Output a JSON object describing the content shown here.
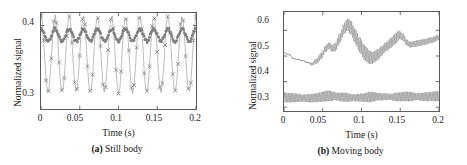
{
  "figure": {
    "panels": [
      {
        "id": "a",
        "caption_tag": "(a)",
        "caption_text": "Still body",
        "chart": {
          "type": "line",
          "title": "",
          "xlabel": "Time (s)",
          "ylabel": "Normalized signal",
          "xlim": [
            0,
            0.2
          ],
          "ylim": [
            0.3,
            0.415
          ],
          "xticks": [
            0,
            0.05,
            0.1,
            0.15,
            0.2
          ],
          "xticklabels": [
            "0",
            "0.05",
            "0.1",
            "0.15",
            "0.2"
          ],
          "yticks": [
            0.3,
            0.4
          ],
          "yticklabels": [
            "0.3",
            "0.4"
          ],
          "grid": false,
          "legend": "none",
          "series": [
            {
              "name": "large-oscillation-trace",
              "marker": "x",
              "color": "#6e6e6e",
              "period_s": 0.0182,
              "mean": 0.3655,
              "amplitude": 0.0455,
              "phase": 0.0,
              "jitter": 0.004,
              "n_points": 120,
              "y_min": 0.318,
              "y_max": 0.413
            },
            {
              "name": "small-oscillation-trace",
              "marker": "filled-circle",
              "color": "#7a7a7a",
              "period_s": 0.0182,
              "mean": 0.3885,
              "amplitude": 0.0075,
              "phase": 0.0,
              "jitter": 0.0035,
              "n_points": 200,
              "y_min": 0.378,
              "y_max": 0.401
            }
          ]
        }
      },
      {
        "id": "b",
        "caption_tag": "(b)",
        "caption_text": "Moving body",
        "chart": {
          "type": "line",
          "title": "",
          "xlabel": "Time (s)",
          "ylabel": "Normalized signal",
          "xlim": [
            0,
            0.2
          ],
          "ylim": [
            0.285,
            0.672
          ],
          "xticks": [
            0,
            0.05,
            0.1,
            0.15,
            0.2
          ],
          "xticklabels": [
            "0",
            "0.05",
            "0.1",
            "0.15",
            "0.2"
          ],
          "yticks": [
            0.3,
            0.4,
            0.5,
            0.6
          ],
          "yticklabels": [
            "0.3",
            "0.4",
            "0.5",
            "0.6"
          ],
          "grid": false,
          "legend": "none",
          "series": [
            {
              "name": "upper-trace",
              "color": "#6e6e6e",
              "carrier_period_s": 0.00185,
              "baseline_x": [
                0,
                0.006,
                0.012,
                0.018,
                0.024,
                0.03,
                0.036,
                0.042,
                0.048,
                0.054,
                0.058,
                0.062,
                0.066,
                0.072,
                0.078,
                0.082,
                0.086,
                0.092,
                0.098,
                0.104,
                0.11,
                0.114,
                0.12,
                0.126,
                0.132,
                0.138,
                0.144,
                0.149,
                0.154,
                0.158,
                0.163,
                0.17,
                0.176,
                0.182,
                0.19,
                0.2
              ],
              "baseline_y": [
                0.513,
                0.506,
                0.49,
                0.486,
                0.482,
                0.475,
                0.468,
                0.48,
                0.5,
                0.53,
                0.541,
                0.53,
                0.534,
                0.57,
                0.608,
                0.623,
                0.612,
                0.576,
                0.541,
                0.513,
                0.496,
                0.492,
                0.503,
                0.52,
                0.537,
                0.552,
                0.568,
                0.582,
                0.573,
                0.553,
                0.544,
                0.548,
                0.552,
                0.556,
                0.562,
                0.572
              ],
              "ripple_x": [
                0,
                0.03,
                0.036,
                0.046,
                0.06,
                0.075,
                0.09,
                0.105,
                0.118,
                0.13,
                0.145,
                0.152,
                0.162,
                0.175,
                0.19,
                0.2
              ],
              "ripple_amp": [
                0.0,
                0.0,
                0.006,
                0.012,
                0.013,
                0.02,
                0.028,
                0.029,
                0.022,
                0.018,
                0.021,
                0.014,
                0.011,
                0.012,
                0.011,
                0.01
              ],
              "y_min": 0.455,
              "y_max": 0.655
            },
            {
              "name": "lower-trace",
              "color": "#6e6e6e",
              "carrier_period_s": 0.00175,
              "baseline_x": [
                0,
                0.008,
                0.016,
                0.024,
                0.032,
                0.04,
                0.048,
                0.056,
                0.064,
                0.072,
                0.08,
                0.088,
                0.096,
                0.104,
                0.112,
                0.12,
                0.128,
                0.136,
                0.144,
                0.152,
                0.16,
                0.168,
                0.176,
                0.184,
                0.192,
                0.2
              ],
              "baseline_y": [
                0.338,
                0.337,
                0.336,
                0.335,
                0.335,
                0.336,
                0.34,
                0.344,
                0.343,
                0.34,
                0.338,
                0.337,
                0.337,
                0.338,
                0.34,
                0.341,
                0.341,
                0.34,
                0.34,
                0.341,
                0.342,
                0.342,
                0.341,
                0.341,
                0.342,
                0.343
              ],
              "ripple_x": [
                0,
                0.012,
                0.024,
                0.036,
                0.048,
                0.058,
                0.068,
                0.08,
                0.09,
                0.1,
                0.112,
                0.124,
                0.136,
                0.148,
                0.16,
                0.172,
                0.184,
                0.2
              ],
              "ripple_amp": [
                0.019,
                0.018,
                0.014,
                0.016,
                0.019,
                0.021,
                0.015,
                0.018,
                0.013,
                0.016,
                0.02,
                0.014,
                0.012,
                0.017,
                0.019,
                0.014,
                0.017,
                0.02
              ],
              "y_min": 0.303,
              "y_max": 0.368
            }
          ]
        }
      }
    ]
  }
}
